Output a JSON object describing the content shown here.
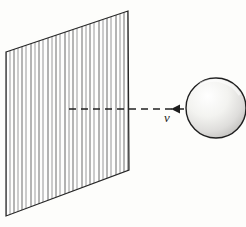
{
  "figure": {
    "background_color": "#fdfdfb",
    "ink_color": "#1d1d1d",
    "labels": {
      "velocity": "v"
    },
    "wall": {
      "name": "hatched-plane",
      "shape": "parallelogram",
      "corners": [
        [
          6,
          52
        ],
        [
          128,
          11
        ],
        [
          129,
          170
        ],
        [
          6,
          216
        ]
      ],
      "hatch_count": 29,
      "hatch_color": "#6f6f6f",
      "edge_color": "#262626"
    },
    "ball": {
      "name": "sphere",
      "center": [
        216,
        108
      ],
      "radius": 30,
      "outline_color": "#1f1f1f",
      "shading": "stippled, darker toward lower-right",
      "stipple_color": "#8c8c8c"
    },
    "trajectory": {
      "name": "velocity-dashed-line",
      "from": [
        69,
        109
      ],
      "to": [
        214,
        109
      ],
      "dash_pattern": "7,5",
      "arrow_tip": [
        171,
        109
      ],
      "arrow_direction": "left",
      "color": "#222222"
    }
  }
}
